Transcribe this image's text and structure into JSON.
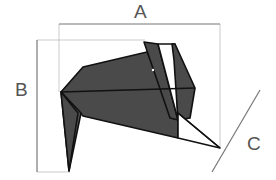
{
  "diagram": {
    "labels": {
      "width": "A",
      "height": "B",
      "depth": "C"
    },
    "colors": {
      "fill": "#4a4a4a",
      "stroke": "#111111",
      "guide": "#999999",
      "label": "#555555"
    }
  }
}
